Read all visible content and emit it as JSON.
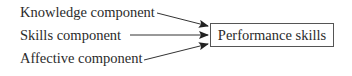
{
  "diagram": {
    "type": "flow",
    "inputs": [
      {
        "label": "Knowledge component"
      },
      {
        "label": "Skills component"
      },
      {
        "label": "Affective component"
      }
    ],
    "output": {
      "label": "Performance skills"
    },
    "edges": [
      {
        "from": "Knowledge component",
        "to": "Performance skills"
      },
      {
        "from": "Skills component",
        "to": "Performance skills"
      },
      {
        "from": "Affective component",
        "to": "Performance skills"
      }
    ],
    "colors": {
      "line": "#333333",
      "text": "#2b2b2b",
      "box_border": "#555555"
    }
  }
}
